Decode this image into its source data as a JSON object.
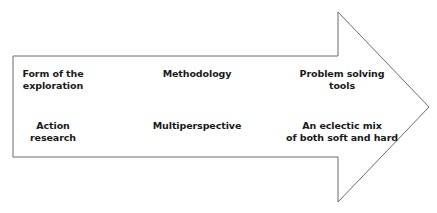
{
  "diagram": {
    "type": "arrow-flow",
    "columns": [
      {
        "header": [
          "Form of the",
          "exploration"
        ],
        "value": [
          "Action",
          "research"
        ]
      },
      {
        "header": [
          "Methodology"
        ],
        "value": [
          "Multiperspective"
        ]
      },
      {
        "header": [
          "Problem solving",
          "tools"
        ],
        "value": [
          "An eclectic mix",
          "of both soft and hard"
        ]
      }
    ]
  }
}
